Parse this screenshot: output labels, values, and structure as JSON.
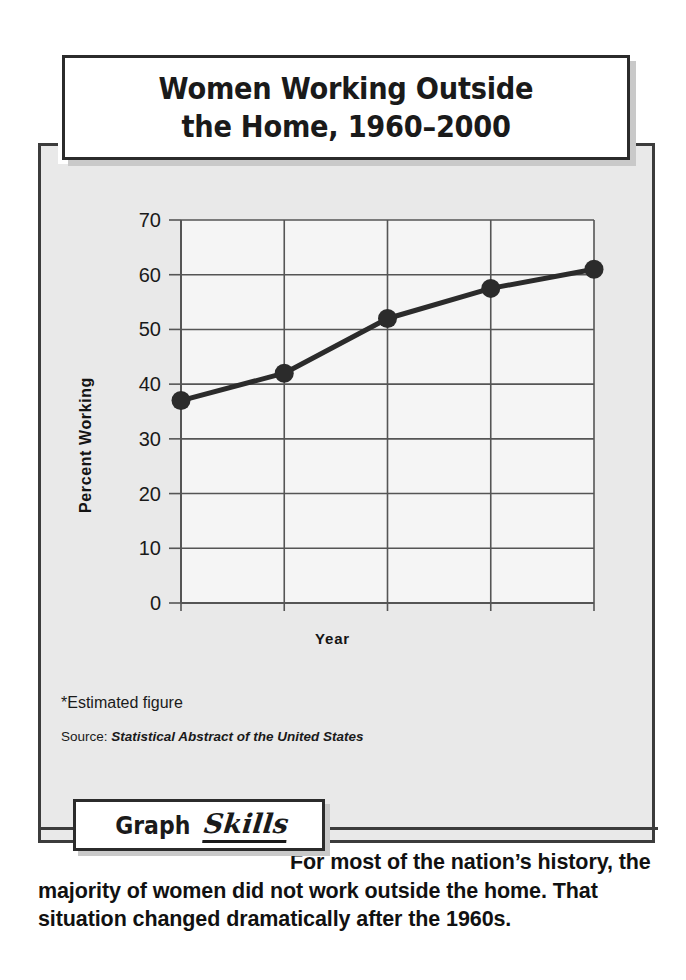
{
  "title": {
    "line1": "Women Working Outside",
    "line2": "the Home, 1960–2000"
  },
  "chart_data": {
    "type": "line",
    "title": "Women Working Outside the Home, 1960–2000",
    "xlabel": "Year",
    "ylabel": "Percent Working",
    "categories": [
      "1960",
      "1970",
      "1980",
      "1990",
      "2000*"
    ],
    "x": [
      1960,
      1970,
      1980,
      1990,
      2000
    ],
    "values": [
      37,
      42,
      52,
      57.5,
      61
    ],
    "ylim": [
      0,
      70
    ],
    "yticks": [
      0,
      10,
      20,
      30,
      40,
      50,
      60,
      70
    ],
    "ytick_labels": [
      "0",
      "10",
      "20",
      "30",
      "40",
      "50",
      "60",
      "70"
    ],
    "xtick_labels": [
      "1960",
      "1970",
      "1980",
      "1990",
      "2000*"
    ],
    "grid": true,
    "legend": "none",
    "series": [
      {
        "name": "Percent Working",
        "values": [
          37,
          42,
          52,
          57.5,
          61
        ],
        "color": "#2b2b2b",
        "marker": "circle"
      }
    ]
  },
  "footnote": "*Estimated figure",
  "source": {
    "label": "Source:",
    "title": "Statistical Abstract of the United States"
  },
  "badge": {
    "word1": "Graph",
    "word2": "Skills"
  },
  "body": {
    "text": "For most of the nation’s history, the majority of women did not work outside the home. That situation changed dramatically after the 1960s."
  },
  "colors": {
    "panel_bg": "#e9e9e9",
    "frame": "#3c3c3c",
    "ink": "#1a1a1a",
    "line": "#2b2b2b",
    "plot_bg": "#f5f5f5",
    "shadow": "#c9c9c9"
  }
}
